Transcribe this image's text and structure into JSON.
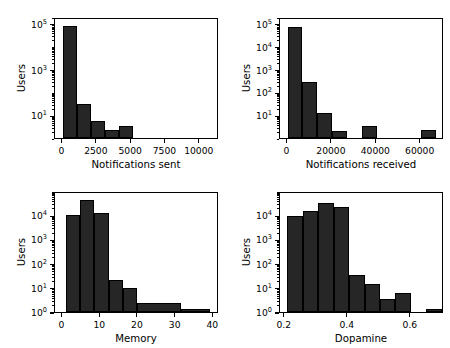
{
  "figure": {
    "background_color": "#ffffff",
    "bar_color": "#262626",
    "bar_edge_color": "#000000",
    "axis_color": "#000000",
    "ylabel_shared": "Users"
  },
  "chart_data": [
    {
      "type": "bar",
      "subplot": "top-left",
      "title": "",
      "xlabel": "Notifications sent",
      "ylabel": "Users",
      "yscale": "log",
      "xlim": [
        -550,
        11400
      ],
      "ylim": [
        1,
        200000
      ],
      "grid": false,
      "legend": null,
      "xticks": [
        0,
        2500,
        5000,
        7500,
        10000
      ],
      "xtick_labels": [
        "0",
        "2500",
        "5000",
        "7500",
        "10000"
      ],
      "yticks": [
        10,
        1000,
        100000
      ],
      "ytick_labels": [
        "10^1",
        "10^3",
        "10^5"
      ],
      "bin_edges": [
        0,
        1030,
        2060,
        3090,
        4120,
        5150,
        6180,
        7210,
        8240,
        9270,
        10300,
        11330
      ],
      "values": [
        80000,
        31,
        5.5,
        2.2,
        3.2,
        0,
        0,
        1,
        0,
        1,
        0
      ],
      "categories": [
        "0-1030",
        "1030-2060",
        "2060-3090",
        "3090-4120",
        "4120-5150",
        "5150-6180",
        "6180-7210",
        "7210-8240",
        "8240-9270",
        "9270-10300",
        "10300-11330"
      ]
    },
    {
      "type": "bar",
      "subplot": "top-right",
      "title": "",
      "xlabel": "Notifications received",
      "ylabel": "Users",
      "yscale": "log",
      "xlim": [
        -3400,
        70500
      ],
      "ylim": [
        1,
        200000
      ],
      "grid": false,
      "legend": null,
      "xticks": [
        0,
        20000,
        40000,
        60000
      ],
      "xtick_labels": [
        "0",
        "20000",
        "40000",
        "60000"
      ],
      "yticks": [
        10,
        100,
        1000,
        10000,
        100000
      ],
      "ytick_labels": [
        "10^1",
        "10^2",
        "10^3",
        "10^4",
        "10^5"
      ],
      "bin_edges": [
        0,
        6700,
        13400,
        20100,
        26800,
        33500,
        40200,
        46900,
        53600,
        60300,
        67000
      ],
      "values": [
        70000,
        290,
        12,
        2,
        0,
        3.2,
        0,
        0,
        0,
        2.2
      ],
      "categories": [
        "0-6700",
        "6700-13400",
        "13400-20100",
        "20100-26800",
        "26800-33500",
        "33500-40200",
        "40200-46900",
        "46900-53600",
        "53600-60300",
        "60300-67000"
      ]
    },
    {
      "type": "bar",
      "subplot": "bottom-left",
      "title": "",
      "xlabel": "Memory",
      "ylabel": "Users",
      "yscale": "log",
      "xlim": [
        -2.0,
        41.5
      ],
      "ylim": [
        1,
        100000
      ],
      "grid": false,
      "legend": null,
      "xticks": [
        0,
        10,
        20,
        30,
        40
      ],
      "xtick_labels": [
        "0",
        "10",
        "20",
        "30",
        "40"
      ],
      "yticks": [
        1,
        10,
        100,
        1000,
        10000
      ],
      "ytick_labels": [
        "10^0",
        "10^1",
        "10^2",
        "10^3",
        "10^4"
      ],
      "bin_edges": [
        0.8,
        4.6,
        8.4,
        12.2,
        16.0,
        19.8,
        31.3,
        39.0
      ],
      "values": [
        9800,
        42000,
        12500,
        22,
        10,
        2.4,
        1.3
      ],
      "categories": [
        "0.8-4.6",
        "4.6-8.4",
        "8.4-12.2",
        "12.2-16.0",
        "16.0-19.8",
        "19.8-31.3",
        "31.3-39.0"
      ]
    },
    {
      "type": "bar",
      "subplot": "bottom-right",
      "title": "",
      "xlabel": "Dopamine",
      "ylabel": "Users",
      "yscale": "log",
      "xlim": [
        0.185,
        0.705
      ],
      "ylim": [
        1,
        100000
      ],
      "grid": false,
      "legend": null,
      "xticks": [
        0.2,
        0.4,
        0.6
      ],
      "xtick_labels": [
        "0.2",
        "0.4",
        "0.6"
      ],
      "yticks": [
        1,
        10,
        100,
        1000,
        10000
      ],
      "ytick_labels": [
        "10^0",
        "10^1",
        "10^2",
        "10^3",
        "10^4"
      ],
      "bin_edges": [
        0.208,
        0.257,
        0.306,
        0.355,
        0.404,
        0.453,
        0.502,
        0.551,
        0.6,
        0.649,
        0.698
      ],
      "values": [
        9200,
        15000,
        31000,
        21000,
        33,
        15,
        3.6,
        6.2,
        0,
        1.3
      ],
      "categories": [
        "0.208-0.257",
        "0.257-0.306",
        "0.306-0.355",
        "0.355-0.404",
        "0.404-0.453",
        "0.453-0.502",
        "0.502-0.551",
        "0.551-0.600",
        "0.600-0.649",
        "0.649-0.698"
      ]
    }
  ]
}
